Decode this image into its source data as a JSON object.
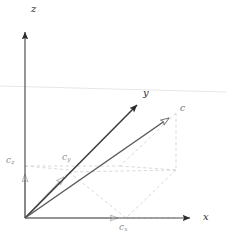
{
  "figure": {
    "background_color": "#ffffff",
    "width": 226,
    "height": 240
  },
  "colors": {
    "axis": "#2b2b2b",
    "axis_light": "#7a7a7a",
    "vector_main": "#5a5a5a",
    "vector_component": "#b0b0b0",
    "dashed_guide": "#cfcfcf",
    "plane_line": "#e2e2e2",
    "label_dark": "#2b2b2b",
    "label_gray": "#8c8c8c"
  },
  "axes": [
    {
      "id": "x",
      "label": "x",
      "label_base": "x",
      "label_sub": "",
      "arrowhead": "solid",
      "color": "#2b2b2b",
      "from": [
        25,
        218
      ],
      "to": [
        197,
        218
      ]
    },
    {
      "id": "y",
      "label": "y",
      "label_base": "y",
      "label_sub": "",
      "arrowhead": "solid",
      "color": "#2b2b2b",
      "from": [
        25,
        218
      ],
      "to": [
        143,
        99
      ]
    },
    {
      "id": "z",
      "label": "z",
      "label_base": "z",
      "label_sub": "",
      "arrowhead": "solid",
      "color": "#2b2b2b",
      "from": [
        25,
        218
      ],
      "to": [
        25,
        24
      ]
    }
  ],
  "vectors": [
    {
      "id": "c",
      "label": "c",
      "label_base": "c",
      "label_sub": "",
      "arrowhead": "open",
      "role": "resultant",
      "color": "#5a5a5a",
      "from": [
        25,
        218
      ],
      "to": [
        176,
        113
      ]
    },
    {
      "id": "cy",
      "label": "c_y",
      "label_base": "c",
      "label_sub": "y",
      "arrowhead": "open",
      "role": "component",
      "axis": "y",
      "color": "#b0b0b0",
      "from": [
        25,
        218
      ],
      "to": [
        69,
        172
      ]
    },
    {
      "id": "cz",
      "label": "c_z",
      "label_base": "c",
      "label_sub": "z",
      "arrowhead": "open",
      "role": "component",
      "axis": "z",
      "color": "#b0b0b0",
      "from": [
        25,
        218
      ],
      "to": [
        25,
        166
      ]
    },
    {
      "id": "cx",
      "label": "c_x",
      "label_base": "c",
      "label_sub": "x",
      "arrowhead": "open",
      "role": "component",
      "axis": "x",
      "color": "#b0b0b0",
      "from": [
        25,
        218
      ],
      "to": [
        126,
        218
      ]
    }
  ],
  "labels": {
    "axis_x": "x",
    "axis_y": "y",
    "axis_z": "z",
    "vector_c": "c",
    "component_x_base": "c",
    "component_x_sub": "x",
    "component_y_base": "c",
    "component_y_sub": "y",
    "component_z_base": "c",
    "component_z_sub": "z"
  },
  "guides": {
    "style": "dashed",
    "color": "#cfcfcf",
    "description": "parallelepiped construction lines projecting vector c onto the x, y and z axes",
    "plane_line": {
      "description": "faint horizontal reference plane line spanning full width",
      "from": [
        0,
        86
      ],
      "to": [
        226,
        92
      ]
    }
  }
}
